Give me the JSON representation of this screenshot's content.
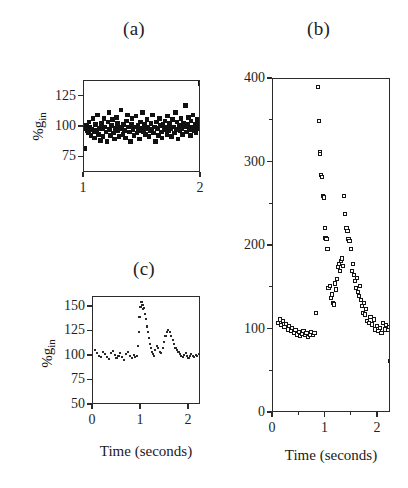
{
  "figure": {
    "panel_a_label": "(a)",
    "panel_b_label": "(b)",
    "panel_c_label": "(c)"
  },
  "chart_data": [
    {
      "id": "panel-a",
      "type": "scatter",
      "title": "(a)",
      "xlabel": "",
      "ylabel": "%g in",
      "ylabel_text": "%g",
      "ylabel_sub": "in",
      "xlim": [
        1,
        2
      ],
      "ylim": [
        62,
        138
      ],
      "xticks": [
        1,
        2
      ],
      "xticklabels": [
        "1",
        "2"
      ],
      "yticks": [
        75,
        100,
        125
      ],
      "yticklabels": [
        "75",
        "100",
        "125"
      ],
      "grid": false,
      "marker": "filled-square",
      "x": [
        1.005,
        1.013,
        1.021,
        1.029,
        1.036,
        1.044,
        1.052,
        1.06,
        1.068,
        1.076,
        1.084,
        1.092,
        1.1,
        1.108,
        1.116,
        1.124,
        1.132,
        1.14,
        1.148,
        1.156,
        1.164,
        1.172,
        1.18,
        1.188,
        1.196,
        1.204,
        1.212,
        1.22,
        1.228,
        1.236,
        1.244,
        1.252,
        1.26,
        1.268,
        1.276,
        1.284,
        1.292,
        1.3,
        1.308,
        1.316,
        1.324,
        1.332,
        1.34,
        1.348,
        1.356,
        1.364,
        1.372,
        1.38,
        1.388,
        1.396,
        1.404,
        1.412,
        1.42,
        1.428,
        1.436,
        1.444,
        1.452,
        1.46,
        1.468,
        1.476,
        1.484,
        1.492,
        1.5,
        1.508,
        1.516,
        1.524,
        1.532,
        1.54,
        1.548,
        1.556,
        1.564,
        1.572,
        1.58,
        1.588,
        1.596,
        1.604,
        1.612,
        1.62,
        1.628,
        1.636,
        1.644,
        1.652,
        1.66,
        1.668,
        1.676,
        1.684,
        1.692,
        1.7,
        1.708,
        1.716,
        1.724,
        1.732,
        1.74,
        1.748,
        1.756,
        1.764,
        1.772,
        1.78,
        1.788,
        1.796,
        1.804,
        1.812,
        1.82,
        1.828,
        1.836,
        1.844,
        1.852,
        1.86,
        1.868,
        1.876,
        1.884,
        1.892,
        1.9,
        1.908,
        1.916,
        1.924,
        1.932,
        1.94,
        1.948,
        1.956,
        1.964,
        1.972,
        1.98,
        1.988,
        1.994,
        1.998
      ],
      "y": [
        82,
        99,
        101,
        97,
        95,
        104,
        100,
        93,
        98,
        107,
        96,
        91,
        102,
        97,
        110,
        94,
        99,
        89,
        103,
        99,
        92,
        107,
        100,
        96,
        88,
        104,
        112,
        98,
        93,
        101,
        106,
        95,
        90,
        99,
        108,
        103,
        97,
        92,
        100,
        114,
        99,
        94,
        102,
        97,
        91,
        105,
        110,
        100,
        96,
        88,
        102,
        107,
        98,
        93,
        100,
        109,
        95,
        101,
        97,
        90,
        104,
        99,
        112,
        96,
        102,
        94,
        99,
        106,
        100,
        92,
        97,
        103,
        98,
        110,
        95,
        100,
        88,
        104,
        99,
        93,
        107,
        101,
        96,
        91,
        102,
        98,
        105,
        100,
        94,
        109,
        97,
        103,
        99,
        92,
        106,
        100,
        95,
        112,
        98,
        104,
        90,
        101,
        97,
        107,
        99,
        94,
        103,
        100,
        118,
        96,
        102,
        108,
        98,
        93,
        105,
        100,
        110,
        97,
        102,
        95,
        100,
        106,
        99,
        103
      ]
    },
    {
      "id": "panel-b",
      "type": "scatter",
      "title": "(b)",
      "xlabel": "Time (seconds)",
      "ylabel": "",
      "xlim": [
        0,
        2.25
      ],
      "ylim": [
        0,
        400
      ],
      "xticks": [
        0,
        1,
        2
      ],
      "xticklabels": [
        "0",
        "1",
        "2"
      ],
      "xminorticks": [
        0.5,
        1.5
      ],
      "yticks": [
        0,
        100,
        200,
        300,
        400
      ],
      "yticklabels": [
        "0",
        "100",
        "200",
        "300",
        "400"
      ],
      "yminorticks": [
        50,
        150,
        250,
        350
      ],
      "grid": false,
      "marker": "open-square",
      "x": [
        0.1,
        0.13,
        0.16,
        0.19,
        0.22,
        0.25,
        0.28,
        0.31,
        0.34,
        0.37,
        0.4,
        0.43,
        0.46,
        0.49,
        0.52,
        0.55,
        0.58,
        0.61,
        0.64,
        0.67,
        0.7,
        0.73,
        0.76,
        0.79,
        0.82,
        0.86,
        0.88,
        0.89,
        0.9,
        0.91,
        0.93,
        0.95,
        0.97,
        0.99,
        1.0,
        1.02,
        1.04,
        1.06,
        1.08,
        1.1,
        1.12,
        1.14,
        1.16,
        1.18,
        1.2,
        1.22,
        1.24,
        1.26,
        1.28,
        1.3,
        1.32,
        1.34,
        1.36,
        1.38,
        1.4,
        1.42,
        1.44,
        1.46,
        1.48,
        1.5,
        1.52,
        1.54,
        1.56,
        1.58,
        1.6,
        1.62,
        1.64,
        1.66,
        1.68,
        1.7,
        1.72,
        1.74,
        1.76,
        1.78,
        1.8,
        1.83,
        1.86,
        1.89,
        1.92,
        1.95,
        1.98,
        2.01,
        2.04,
        2.07,
        2.1,
        2.13,
        2.16,
        2.19,
        2.21,
        2.23
      ],
      "y": [
        108,
        112,
        105,
        110,
        103,
        107,
        100,
        104,
        98,
        102,
        96,
        99,
        94,
        97,
        92,
        95,
        98,
        93,
        96,
        91,
        94,
        97,
        93,
        96,
        120,
        390,
        350,
        312,
        310,
        285,
        283,
        260,
        258,
        222,
        210,
        208,
        196,
        150,
        152,
        138,
        142,
        132,
        130,
        155,
        148,
        160,
        175,
        178,
        170,
        182,
        185,
        176,
        260,
        238,
        222,
        218,
        208,
        206,
        196,
        170,
        178,
        165,
        158,
        150,
        162,
        145,
        140,
        152,
        135,
        128,
        120,
        132,
        118,
        125,
        110,
        108,
        115,
        106,
        112,
        100,
        104,
        98,
        102,
        96,
        108,
        100,
        105,
        99,
        103,
        62
      ]
    },
    {
      "id": "panel-c",
      "type": "scatter",
      "title": "(c)",
      "xlabel": "Time (seconds)",
      "ylabel": "%g in",
      "ylabel_text": "%g",
      "ylabel_sub": "in",
      "xlim": [
        0,
        2.25
      ],
      "ylim": [
        50,
        160
      ],
      "xticks": [
        0,
        1,
        2
      ],
      "xticklabels": [
        "0",
        "1",
        "2"
      ],
      "yticks": [
        50,
        75,
        100,
        125,
        150
      ],
      "yticklabels": [
        "50",
        "75",
        "100",
        "125",
        "150"
      ],
      "grid": false,
      "marker": "dot",
      "x": [
        0.05,
        0.09,
        0.13,
        0.17,
        0.21,
        0.25,
        0.29,
        0.33,
        0.37,
        0.41,
        0.45,
        0.49,
        0.53,
        0.57,
        0.61,
        0.65,
        0.69,
        0.73,
        0.77,
        0.81,
        0.85,
        0.88,
        0.91,
        0.93,
        0.95,
        0.97,
        0.99,
        1.01,
        1.03,
        1.05,
        1.07,
        1.09,
        1.11,
        1.13,
        1.15,
        1.17,
        1.19,
        1.21,
        1.23,
        1.25,
        1.27,
        1.3,
        1.33,
        1.36,
        1.39,
        1.42,
        1.45,
        1.48,
        1.51,
        1.54,
        1.57,
        1.6,
        1.63,
        1.66,
        1.69,
        1.72,
        1.75,
        1.78,
        1.81,
        1.84,
        1.87,
        1.9,
        1.93,
        1.96,
        1.99,
        2.02,
        2.05,
        2.08,
        2.11,
        2.14,
        2.17,
        2.2
      ],
      "y": [
        106,
        103,
        100,
        99,
        104,
        102,
        99,
        97,
        103,
        105,
        101,
        98,
        100,
        103,
        99,
        96,
        102,
        104,
        100,
        98,
        101,
        99,
        100,
        110,
        124,
        140,
        150,
        155,
        152,
        148,
        149,
        143,
        138,
        130,
        124,
        118,
        112,
        108,
        104,
        102,
        100,
        106,
        110,
        108,
        104,
        103,
        108,
        114,
        120,
        124,
        126,
        124,
        120,
        116,
        112,
        108,
        106,
        104,
        102,
        100,
        99,
        101,
        103,
        100,
        98,
        100,
        102,
        100,
        99,
        101,
        100,
        102
      ]
    }
  ]
}
